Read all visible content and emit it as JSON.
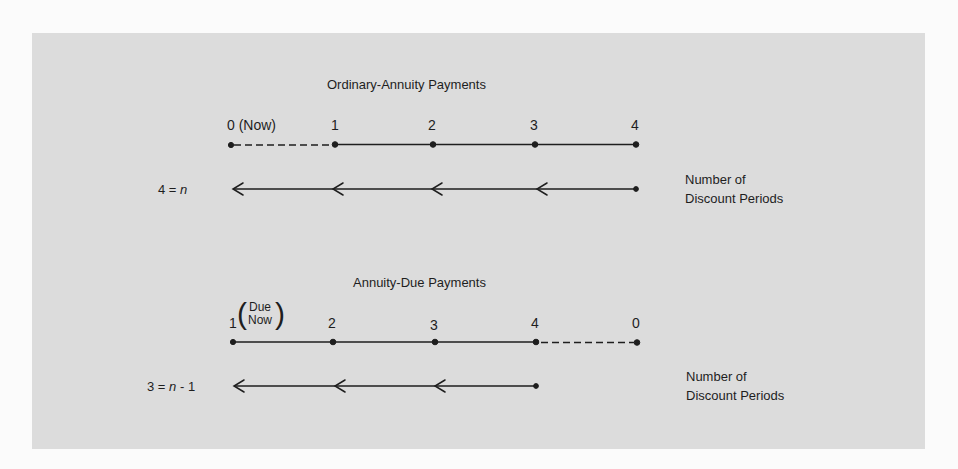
{
  "colors": {
    "background": "#fbfbfb",
    "panel": "#dcdcdc",
    "ink": "#1e1e1e"
  },
  "ordinary": {
    "title": "Ordinary-Annuity Payments",
    "ticks": [
      {
        "label": "0 (Now)",
        "x": 231
      },
      {
        "label": "1",
        "x": 335
      },
      {
        "label": "2",
        "x": 433
      },
      {
        "label": "3",
        "x": 535
      },
      {
        "label": "4",
        "x": 636
      }
    ],
    "dashed_segment": "0 to 1",
    "solid_segment": "1 to 4",
    "equation": {
      "lhs": "4",
      "eq": "=",
      "var": "n",
      "suffix": ""
    },
    "arrow_from": 4,
    "arrow_to": "0",
    "arrowheads": 4,
    "side_label_line1": "Number of",
    "side_label_line2": "Discount Periods"
  },
  "due": {
    "title": "Annuity-Due Payments",
    "ticks": [
      {
        "label": "1",
        "x": 233
      },
      {
        "label": "2",
        "x": 333
      },
      {
        "label": "3",
        "x": 435
      },
      {
        "label": "4",
        "x": 536
      },
      {
        "label": "0",
        "x": 637
      }
    ],
    "first_tick_note_line1": "Due",
    "first_tick_note_line2": "Now",
    "solid_segment": "1 to 4",
    "dashed_segment": "4 to 0",
    "equation": {
      "lhs": "3",
      "eq": "=",
      "var": "n",
      "suffix": "- 1"
    },
    "arrow_from": 4,
    "arrow_to": "1",
    "arrowheads": 3,
    "side_label_line1": "Number of",
    "side_label_line2": "Discount Periods"
  }
}
